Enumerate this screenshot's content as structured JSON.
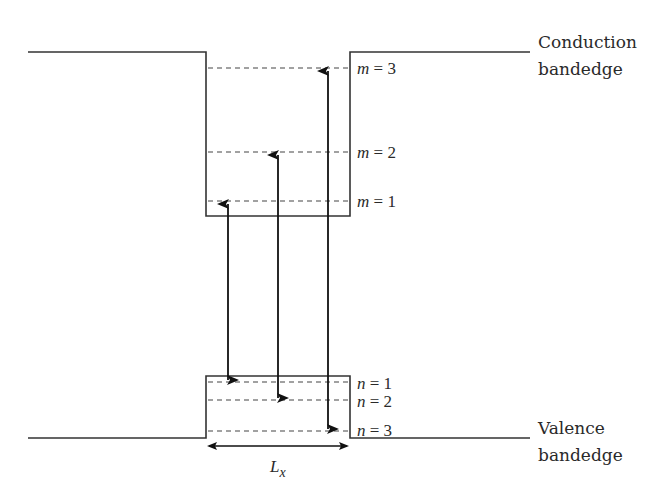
{
  "diagram": {
    "colors": {
      "line": "#333333",
      "text": "#2a2a2a",
      "background": "#ffffff"
    },
    "band_labels": {
      "conduction": {
        "line1": "Conduction",
        "line2": "bandedge"
      },
      "valence": {
        "line1": "Valence",
        "line2": "bandedge"
      }
    },
    "conduction_levels": [
      {
        "var": "m",
        "eq": " = ",
        "num": "3"
      },
      {
        "var": "m",
        "eq": " = ",
        "num": "2"
      },
      {
        "var": "m",
        "eq": " = ",
        "num": "1"
      }
    ],
    "valence_levels": [
      {
        "var": "n",
        "eq": " = ",
        "num": "1"
      },
      {
        "var": "n",
        "eq": " = ",
        "num": "2"
      },
      {
        "var": "n",
        "eq": " = ",
        "num": "3"
      }
    ],
    "width_label": {
      "main": "L",
      "sub": "x"
    },
    "transitions": [
      {
        "from": "n = 1",
        "to": "m = 1"
      },
      {
        "from": "n = 2",
        "to": "m = 2"
      },
      {
        "from": "n = 3",
        "to": "m = 3"
      }
    ]
  }
}
